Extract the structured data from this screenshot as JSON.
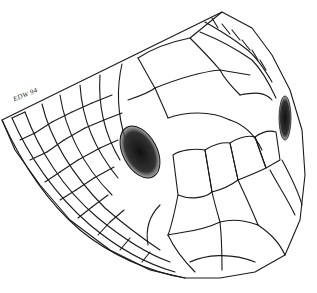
{
  "illustration": {
    "subject": "snake head scale illustration",
    "signature": "EDW 94",
    "colors": {
      "ink": "#1a1a1a",
      "background": "#ffffff",
      "stipple": "#9a9a9a",
      "eye": "#222222"
    }
  }
}
